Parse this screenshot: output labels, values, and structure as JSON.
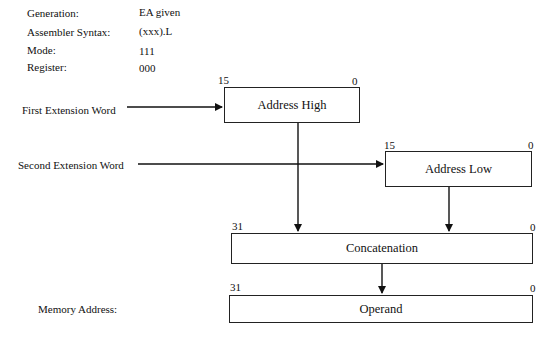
{
  "info": {
    "generation_label": "Generation:",
    "generation_value": "EA given",
    "syntax_label": "Assembler Syntax:",
    "syntax_value": "(xxx).L",
    "mode_label": "Mode:",
    "mode_value": "111",
    "register_label": "Register:",
    "register_value": "000"
  },
  "inputs": {
    "first_ext": "First Extension Word",
    "second_ext": "Second Extension Word",
    "memory_address": "Memory Address:"
  },
  "boxes": {
    "address_high": {
      "label": "Address High",
      "msb": "15",
      "lsb": "0"
    },
    "address_low": {
      "label": "Address Low",
      "msb": "15",
      "lsb": "0"
    },
    "concatenation": {
      "label": "Concatenation",
      "msb": "31",
      "lsb": "0"
    },
    "operand": {
      "label": "Operand",
      "msb": "31",
      "lsb": "0"
    }
  }
}
